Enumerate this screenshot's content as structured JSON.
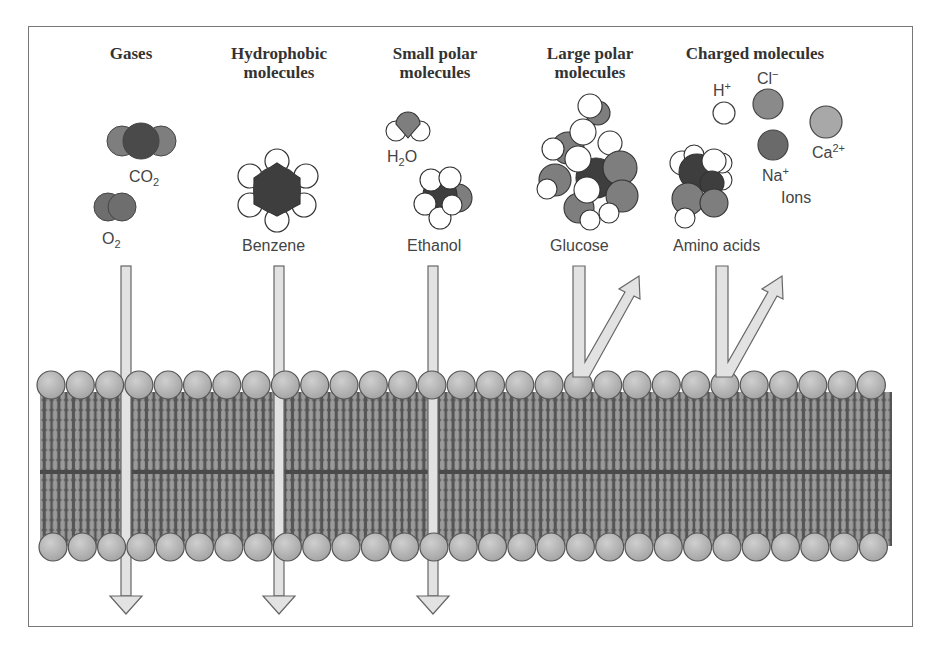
{
  "figure": {
    "categories": [
      {
        "id": "gases",
        "header": "Gases",
        "molecules": [
          "CO2",
          "O2"
        ],
        "permeable": true
      },
      {
        "id": "hydrophobic",
        "header_line1": "Hydrophobic",
        "header_line2": "molecules",
        "molecules": [
          "Benzene"
        ],
        "permeable": true
      },
      {
        "id": "small-polar",
        "header_line1": "Small polar",
        "header_line2": "molecules",
        "molecules": [
          "H2O",
          "Ethanol"
        ],
        "permeable": true
      },
      {
        "id": "large-polar",
        "header_line1": "Large polar",
        "header_line2": "molecules",
        "molecules": [
          "Glucose"
        ],
        "permeable": false
      },
      {
        "id": "charged",
        "header": "Charged molecules",
        "molecules": [
          "Amino acids",
          "H+",
          "Cl-",
          "Na+",
          "Ca2+"
        ],
        "ions_label": "Ions",
        "permeable": false
      }
    ]
  },
  "headers": {
    "gases": "Gases",
    "hydrophobic_1": "Hydrophobic",
    "hydrophobic_2": "molecules",
    "small_polar_1": "Small polar",
    "small_polar_2": "molecules",
    "large_polar_1": "Large polar",
    "large_polar_2": "molecules",
    "charged": "Charged molecules"
  },
  "labels": {
    "co2_base": "CO",
    "co2_sub": "2",
    "o2_base": "O",
    "o2_sub": "2",
    "benzene": "Benzene",
    "h2o_h": "H",
    "h2o_sub": "2",
    "h2o_o": "O",
    "ethanol": "Ethanol",
    "glucose": "Glucose",
    "amino_acids": "Amino acids",
    "h_base": "H",
    "h_sup": "+",
    "cl_base": "Cl",
    "cl_sup": "−",
    "na_base": "Na",
    "na_sup": "+",
    "ca_base": "Ca",
    "ca_sup": "2+",
    "ions": "Ions"
  },
  "colors": {
    "frame": "#777777",
    "head_fill": "#b4b4b4",
    "head_stroke": "#555555",
    "tail_dark": "#555555",
    "tail_light": "#9a9a9a",
    "arrow_fill": "#e2e2e2",
    "arrow_stroke": "#666666",
    "atom_dark": "#4a4a4a",
    "atom_mid": "#7e7e7e",
    "atom_light": "#ffffff"
  }
}
